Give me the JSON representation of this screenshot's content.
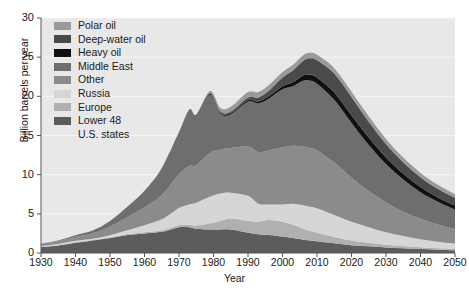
{
  "chart_data": {
    "type": "area",
    "stacked": true,
    "title": "",
    "xlabel": "Year",
    "ylabel": "Billion barrels per year",
    "xlim": [
      1930,
      2050
    ],
    "ylim": [
      0,
      30
    ],
    "xticks": [
      1930,
      1940,
      1950,
      1960,
      1970,
      1980,
      1990,
      2000,
      2010,
      2020,
      2030,
      2040,
      2050
    ],
    "yticks": [
      0,
      5,
      10,
      15,
      20,
      25,
      30
    ],
    "grid": true,
    "legend_position": "top-left",
    "legend_order_top_to_bottom": [
      "Polar oil",
      "Deep-water oil",
      "Heavy oil",
      "Middle East",
      "Other",
      "Russia",
      "Europe",
      "Lower 48 U.S. states"
    ],
    "colors": {
      "Polar oil": "#9a9a9a",
      "Deep-water oil": "#4a4a4a",
      "Heavy oil": "#111111",
      "Middle East": "#6e6e6e",
      "Other": "#8b8b8b",
      "Russia": "#d6d6d6",
      "Europe": "#b0b0b0",
      "Lower 48 U.S. states": "#5c5c5c",
      "plot_background": "#e8e8e8",
      "gridline": "#f5f5f5",
      "axis": "#555555",
      "text": "#1a1a1a"
    },
    "x": [
      1930,
      1935,
      1940,
      1945,
      1950,
      1955,
      1960,
      1965,
      1970,
      1973,
      1975,
      1979,
      1982,
      1985,
      1990,
      1993,
      1996,
      2000,
      2003,
      2006,
      2008,
      2010,
      2015,
      2020,
      2025,
      2030,
      2035,
      2040,
      2045,
      2050
    ],
    "series": [
      {
        "name": "Lower 48 U.S. states",
        "values": [
          0.75,
          0.95,
          1.3,
          1.6,
          1.9,
          2.3,
          2.5,
          2.7,
          3.3,
          3.3,
          3.1,
          3.0,
          3.0,
          3.0,
          2.6,
          2.4,
          2.3,
          2.1,
          1.9,
          1.7,
          1.6,
          1.5,
          1.25,
          1.0,
          0.85,
          0.7,
          0.6,
          0.5,
          0.42,
          0.35
        ]
      },
      {
        "name": "Europe",
        "values": [
          0.05,
          0.05,
          0.06,
          0.06,
          0.08,
          0.1,
          0.15,
          0.2,
          0.25,
          0.3,
          0.4,
          0.8,
          1.1,
          1.4,
          1.5,
          1.6,
          1.9,
          1.9,
          1.7,
          1.4,
          1.2,
          1.1,
          0.8,
          0.6,
          0.45,
          0.35,
          0.28,
          0.22,
          0.18,
          0.15
        ]
      },
      {
        "name": "Russia",
        "values": [
          0.1,
          0.15,
          0.2,
          0.15,
          0.3,
          0.5,
          0.9,
          1.4,
          2.2,
          2.6,
          2.9,
          3.4,
          3.5,
          3.3,
          3.2,
          2.3,
          2.0,
          2.2,
          2.7,
          3.0,
          3.1,
          3.1,
          2.8,
          2.4,
          2.0,
          1.6,
          1.3,
          1.05,
          0.85,
          0.7
        ]
      },
      {
        "name": "Other",
        "values": [
          0.25,
          0.35,
          0.5,
          0.7,
          1.1,
          1.7,
          2.3,
          3.1,
          4.3,
          4.9,
          4.8,
          5.6,
          5.6,
          5.7,
          6.3,
          6.6,
          6.9,
          7.3,
          7.4,
          7.5,
          7.5,
          7.4,
          6.7,
          5.6,
          4.6,
          3.8,
          3.1,
          2.6,
          2.2,
          1.85
        ]
      },
      {
        "name": "Middle East",
        "values": [
          0.05,
          0.1,
          0.2,
          0.35,
          0.7,
          1.3,
          2.1,
          3.4,
          5.3,
          7.1,
          6.3,
          7.4,
          4.6,
          4.3,
          5.7,
          6.2,
          6.6,
          7.4,
          7.6,
          8.4,
          8.6,
          8.5,
          8.0,
          7.0,
          5.9,
          4.9,
          4.1,
          3.4,
          2.9,
          2.5
        ]
      },
      {
        "name": "Heavy oil",
        "values": [
          0.0,
          0.0,
          0.0,
          0.0,
          0.0,
          0.0,
          0.0,
          0.02,
          0.05,
          0.07,
          0.08,
          0.12,
          0.14,
          0.16,
          0.2,
          0.25,
          0.3,
          0.4,
          0.5,
          0.65,
          0.75,
          0.8,
          0.95,
          1.0,
          0.95,
          0.85,
          0.75,
          0.65,
          0.55,
          0.5
        ]
      },
      {
        "name": "Deep-water oil",
        "values": [
          0.0,
          0.0,
          0.0,
          0.0,
          0.0,
          0.0,
          0.0,
          0.0,
          0.02,
          0.04,
          0.06,
          0.1,
          0.14,
          0.2,
          0.35,
          0.5,
          0.7,
          1.1,
          1.5,
          1.9,
          2.1,
          2.2,
          2.4,
          2.3,
          2.0,
          1.7,
          1.45,
          1.25,
          1.1,
          1.0
        ]
      },
      {
        "name": "Polar oil",
        "values": [
          0.0,
          0.0,
          0.0,
          0.0,
          0.0,
          0.0,
          0.0,
          0.0,
          0.0,
          0.02,
          0.05,
          0.25,
          0.45,
          0.6,
          0.7,
          0.7,
          0.7,
          0.7,
          0.7,
          0.7,
          0.7,
          0.7,
          0.7,
          0.7,
          0.7,
          0.65,
          0.6,
          0.55,
          0.5,
          0.45
        ]
      }
    ]
  },
  "legend": {
    "items": [
      {
        "label": "Polar oil"
      },
      {
        "label": "Deep-water oil"
      },
      {
        "label": "Heavy oil"
      },
      {
        "label": "Middle East"
      },
      {
        "label": "Other"
      },
      {
        "label": "Russia"
      },
      {
        "label": "Europe"
      },
      {
        "label": "Lower 48"
      }
    ],
    "last_item_second_line": "U.S. states"
  },
  "axes": {
    "ylabel": "Billion barrels per year",
    "xlabel": "Year",
    "yticks": [
      "30",
      "25",
      "20",
      "15",
      "10",
      "5",
      "0"
    ],
    "xticks": [
      "1930",
      "1940",
      "1950",
      "1960",
      "1970",
      "1980",
      "1990",
      "2000",
      "2010",
      "2020",
      "2030",
      "2040",
      "2050"
    ]
  }
}
